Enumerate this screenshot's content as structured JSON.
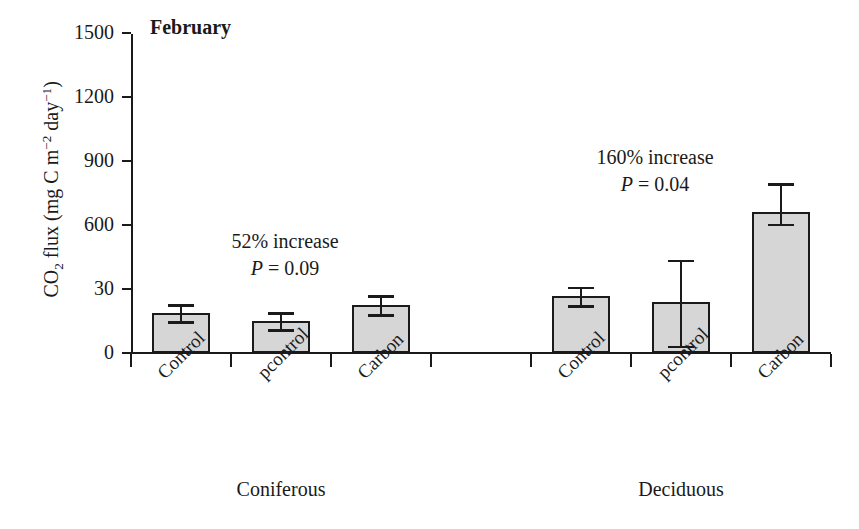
{
  "chart_data": {
    "type": "bar",
    "title": "February",
    "xlabel": "",
    "ylabel": "CO2 flux (mg C m-2 day-1)",
    "ylabel_parts": {
      "prefix": "CO",
      "sub": "2",
      "mid": " flux (mg C m",
      "sup1": "−2",
      "mid2": " day",
      "sup2": "−1",
      "suffix": ")"
    },
    "ylim": [
      0,
      1500
    ],
    "yticks": [
      0,
      30,
      600,
      900,
      1200,
      1500
    ],
    "ytick_labels": [
      "0",
      "30",
      "600",
      "900",
      "1200",
      "1500"
    ],
    "grid": false,
    "legend": "none",
    "categories": [
      "Control",
      "pcontrol",
      "Carbon"
    ],
    "groups": [
      {
        "name": "Coniferous",
        "values": [
          188,
          150,
          225
        ],
        "err_upper": [
          228,
          190,
          270
        ],
        "err_lower": [
          150,
          112,
          182
        ]
      },
      {
        "name": "Deciduous",
        "values": [
          267,
          240,
          660
        ],
        "err_upper": [
          310,
          437,
          795
        ],
        "err_lower": [
          225,
          33,
          605
        ]
      }
    ],
    "annotations": [
      {
        "line1": "52% increase",
        "p_symbol": "P",
        "p_text": " = 0.09"
      },
      {
        "line1": "160% increase",
        "p_symbol": "P",
        "p_text": " = 0.04"
      }
    ],
    "colors": {
      "bar_fill": "#d6d6d6",
      "bar_stroke": "#1a1a1a",
      "axis": "#1a1a1a",
      "background": "#ffffff"
    }
  }
}
